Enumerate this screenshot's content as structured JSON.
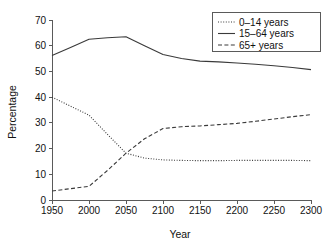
{
  "chart_data": {
    "type": "line",
    "title": "",
    "xlabel": "Year",
    "ylabel": "Percentage",
    "xlim": [
      1950,
      2300
    ],
    "ylim": [
      0,
      70
    ],
    "xticks": [
      1950,
      2000,
      2050,
      2100,
      2150,
      2200,
      2250,
      2300
    ],
    "xtick_labels": [
      "1950",
      "2000",
      "2050",
      "2100",
      "2150",
      "2200",
      "2250",
      "2300"
    ],
    "yticks": [
      0,
      10,
      20,
      30,
      40,
      50,
      60,
      70
    ],
    "ytick_labels": [
      "0",
      "10",
      "20",
      "30",
      "40",
      "50",
      "60",
      "70"
    ],
    "grid": false,
    "legend_position": "top-right",
    "x": [
      1950,
      1975,
      2000,
      2025,
      2050,
      2075,
      2100,
      2125,
      2150,
      2175,
      2200,
      2225,
      2250,
      2275,
      2300
    ],
    "series": [
      {
        "name": "0–14 years",
        "style": "dotted",
        "color": "#3a3a3a",
        "values": [
          40.0,
          36.5,
          33.0,
          25.5,
          18.2,
          16.3,
          15.6,
          15.4,
          15.3,
          15.3,
          15.4,
          15.4,
          15.4,
          15.4,
          15.3
        ]
      },
      {
        "name": "15–64 years",
        "style": "solid",
        "color": "#3a3a3a",
        "values": [
          56.2,
          59.3,
          62.5,
          63.1,
          63.5,
          60.0,
          56.6,
          55.0,
          54.0,
          53.7,
          53.3,
          52.8,
          52.2,
          51.5,
          50.7
        ]
      },
      {
        "name": "65+ years",
        "style": "dashed",
        "color": "#3a3a3a",
        "values": [
          3.5,
          4.4,
          5.3,
          11.5,
          18.2,
          23.8,
          27.8,
          28.5,
          28.8,
          29.3,
          29.8,
          30.6,
          31.5,
          32.4,
          33.2
        ]
      }
    ],
    "legend_entries": [
      {
        "label": "0–14 years",
        "style": "dotted"
      },
      {
        "label": "15–64 years",
        "style": "solid"
      },
      {
        "label": "65+ years",
        "style": "dashed"
      }
    ]
  }
}
